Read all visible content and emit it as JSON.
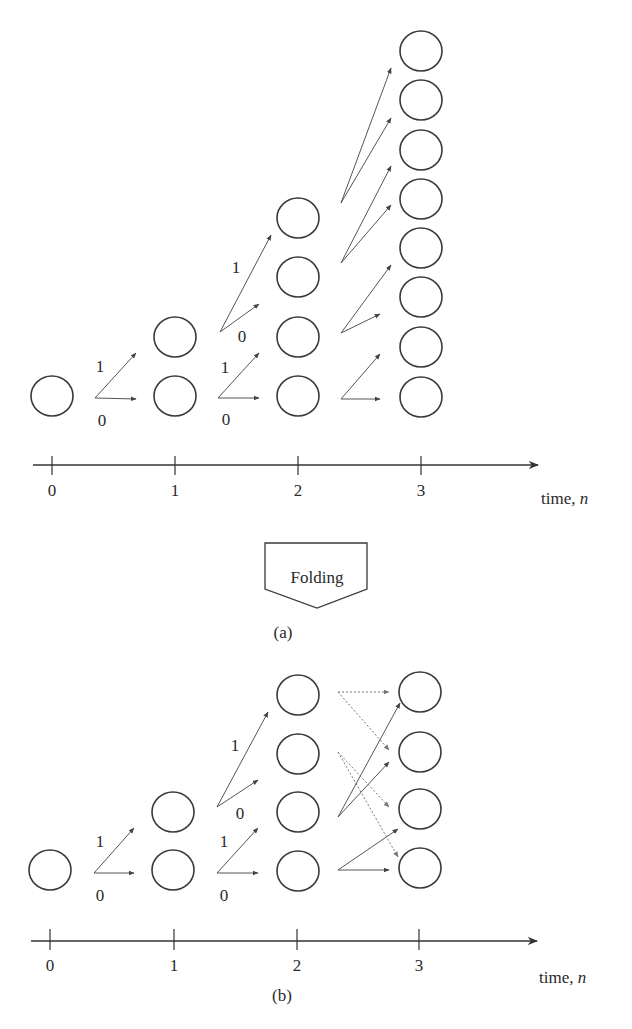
{
  "node_radius": {
    "rx": 21,
    "ry": 20
  },
  "colors": {
    "stroke": "#3a3a3a",
    "edge": "#555555",
    "dotted_edge": "#777777",
    "background": "#ffffff"
  },
  "folding": {
    "label": "Folding",
    "points": [
      [
        265,
        543
      ],
      [
        367,
        543
      ],
      [
        367,
        589
      ],
      [
        317,
        608
      ],
      [
        265,
        589
      ]
    ],
    "text_pos": [
      317,
      583
    ]
  },
  "figures": [
    {
      "id": "a",
      "caption": "(a)",
      "caption_pos": [
        283,
        638
      ],
      "axis": {
        "y": 465,
        "x_start": 33,
        "x_end": 538,
        "tick_top": 456,
        "tick_bottom": 475,
        "label_baseline": 496,
        "ticks": [
          {
            "x": 52,
            "label": "0"
          },
          {
            "x": 175,
            "label": "1"
          },
          {
            "x": 298,
            "label": "2"
          },
          {
            "x": 421,
            "label": "3"
          }
        ],
        "label": {
          "text": "time, ",
          "variable": "n",
          "x": 541,
          "y": 504
        }
      },
      "columns": [
        {
          "time": 0,
          "x": 52,
          "ys": [
            396
          ]
        },
        {
          "time": 1,
          "x": 175,
          "ys": [
            337,
            396
          ]
        },
        {
          "time": 2,
          "x": 298,
          "ys": [
            218,
            277,
            337,
            396
          ]
        },
        {
          "time": 3,
          "x": 421,
          "ys": [
            51,
            100,
            150,
            199,
            248,
            297,
            347,
            397
          ]
        }
      ],
      "edges": [
        {
          "from": [
            95,
            398
          ],
          "to": [
            136,
            353
          ],
          "style": "solid",
          "bit": "1"
        },
        {
          "from": [
            95,
            398
          ],
          "to": [
            136,
            399
          ],
          "style": "solid",
          "bit": "0"
        },
        {
          "from": [
            218,
            398
          ],
          "to": [
            259,
            353
          ],
          "style": "solid",
          "bit": "1"
        },
        {
          "from": [
            218,
            398
          ],
          "to": [
            259,
            398
          ],
          "style": "solid",
          "bit": "0"
        },
        {
          "from": [
            220,
            332
          ],
          "to": [
            271,
            235
          ],
          "style": "solid",
          "bit": "1"
        },
        {
          "from": [
            220,
            332
          ],
          "to": [
            259,
            304
          ],
          "style": "solid",
          "bit": "0"
        },
        {
          "from": [
            341,
            203
          ],
          "to": [
            391,
            68
          ],
          "style": "solid"
        },
        {
          "from": [
            341,
            203
          ],
          "to": [
            391,
            118
          ],
          "style": "solid"
        },
        {
          "from": [
            341,
            263
          ],
          "to": [
            391,
            166
          ],
          "style": "solid"
        },
        {
          "from": [
            341,
            263
          ],
          "to": [
            391,
            205
          ],
          "style": "solid"
        },
        {
          "from": [
            341,
            333
          ],
          "to": [
            391,
            265
          ],
          "style": "solid"
        },
        {
          "from": [
            341,
            333
          ],
          "to": [
            380,
            314
          ],
          "style": "solid"
        },
        {
          "from": [
            341,
            399
          ],
          "to": [
            380,
            354
          ],
          "style": "solid"
        },
        {
          "from": [
            341,
            399
          ],
          "to": [
            380,
            399
          ],
          "style": "solid"
        }
      ],
      "edge_labels": [
        {
          "text": "1",
          "x": 100,
          "y": 372
        },
        {
          "text": "0",
          "x": 102,
          "y": 426
        },
        {
          "text": "1",
          "x": 225,
          "y": 373
        },
        {
          "text": "0",
          "x": 226,
          "y": 425
        },
        {
          "text": "1",
          "x": 236,
          "y": 273
        },
        {
          "text": "0",
          "x": 242,
          "y": 342
        }
      ]
    },
    {
      "id": "b",
      "caption": "(b)",
      "caption_pos": [
        282,
        1001
      ],
      "axis": {
        "y": 941,
        "x_start": 31,
        "x_end": 537,
        "tick_top": 929,
        "tick_bottom": 950,
        "label_baseline": 971,
        "ticks": [
          {
            "x": 50,
            "label": "0"
          },
          {
            "x": 174,
            "label": "1"
          },
          {
            "x": 297,
            "label": "2"
          },
          {
            "x": 419,
            "label": "3"
          }
        ],
        "label": {
          "text": "time, ",
          "variable": "n",
          "x": 539,
          "y": 983
        }
      },
      "columns": [
        {
          "time": 0,
          "x": 50,
          "ys": [
            870
          ]
        },
        {
          "time": 1,
          "x": 173,
          "ys": [
            812,
            870
          ]
        },
        {
          "time": 2,
          "x": 298,
          "ys": [
            695,
            754,
            812,
            871
          ]
        },
        {
          "time": 3,
          "x": 420,
          "ys": [
            692,
            752,
            809,
            868
          ]
        }
      ],
      "edges": [
        {
          "from": [
            94,
            873
          ],
          "to": [
            134,
            828
          ],
          "style": "solid",
          "bit": "1"
        },
        {
          "from": [
            94,
            873
          ],
          "to": [
            134,
            873
          ],
          "style": "solid",
          "bit": "0"
        },
        {
          "from": [
            217,
            873
          ],
          "to": [
            258,
            828
          ],
          "style": "solid",
          "bit": "1"
        },
        {
          "from": [
            217,
            873
          ],
          "to": [
            258,
            873
          ],
          "style": "solid",
          "bit": "0"
        },
        {
          "from": [
            217,
            807
          ],
          "to": [
            268,
            712
          ],
          "style": "solid",
          "bit": "1"
        },
        {
          "from": [
            217,
            807
          ],
          "to": [
            258,
            780
          ],
          "style": "solid",
          "bit": "0"
        },
        {
          "from": [
            338,
            692
          ],
          "to": [
            389,
            692
          ],
          "style": "dotted"
        },
        {
          "from": [
            338,
            692
          ],
          "to": [
            389,
            750
          ],
          "style": "dotted"
        },
        {
          "from": [
            338,
            752
          ],
          "to": [
            389,
            807
          ],
          "style": "dotted"
        },
        {
          "from": [
            338,
            752
          ],
          "to": [
            398,
            857
          ],
          "style": "dotted"
        },
        {
          "from": [
            338,
            817
          ],
          "to": [
            400,
            703
          ],
          "style": "solid"
        },
        {
          "from": [
            338,
            817
          ],
          "to": [
            389,
            762
          ],
          "style": "solid"
        },
        {
          "from": [
            338,
            870
          ],
          "to": [
            398,
            829
          ],
          "style": "solid"
        },
        {
          "from": [
            338,
            870
          ],
          "to": [
            389,
            870
          ],
          "style": "solid"
        }
      ],
      "edge_labels": [
        {
          "text": "1",
          "x": 100,
          "y": 847
        },
        {
          "text": "0",
          "x": 100,
          "y": 901
        },
        {
          "text": "1",
          "x": 224,
          "y": 847
        },
        {
          "text": "0",
          "x": 224,
          "y": 901
        },
        {
          "text": "1",
          "x": 235,
          "y": 751
        },
        {
          "text": "0",
          "x": 240,
          "y": 819
        }
      ]
    }
  ]
}
